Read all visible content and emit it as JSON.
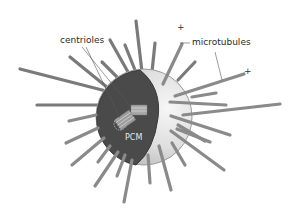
{
  "diagram": {
    "labels": {
      "centrioles": "centrioles",
      "microtubules": "microtubules",
      "pcm": "PCM",
      "plus_end_1": "+",
      "plus_end_2": "+"
    },
    "colors": {
      "pcm_dark": "#4a4a4a",
      "sphere_light": "#dcdcdc",
      "sphere_highlight": "#f4f4f4",
      "microtubule": "#8a8a8a",
      "microtubule_edge": "#6e6e6e",
      "leader_line": "#555555"
    }
  }
}
